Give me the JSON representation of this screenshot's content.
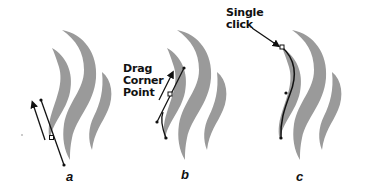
{
  "diagram": {
    "panels": [
      {
        "id": "a",
        "letter": "a",
        "callout": null
      },
      {
        "id": "b",
        "letter": "b",
        "callout": {
          "lines": [
            "Drag",
            "Corner",
            "Point"
          ]
        }
      },
      {
        "id": "c",
        "letter": "c",
        "callout": {
          "lines": [
            "Single",
            "click"
          ]
        }
      }
    ],
    "colors": {
      "flame_fill": "#9a9a9a",
      "stroke": "#111111",
      "background": "#ffffff"
    }
  }
}
